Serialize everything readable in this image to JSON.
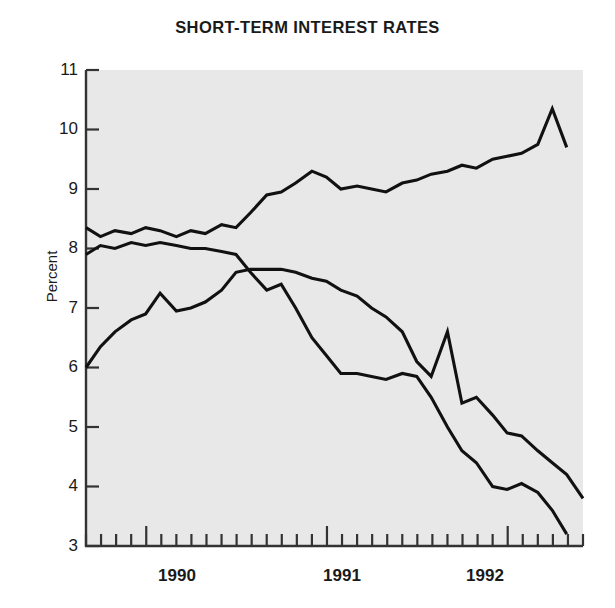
{
  "chart_data": {
    "type": "line",
    "title": "SHORT-TERM INTEREST RATES",
    "xlabel": "",
    "ylabel": "Percent",
    "ylim": [
      3,
      11
    ],
    "xlim": [
      1989.67,
      1992.42
    ],
    "grid": false,
    "legend_position": "inline-annotations",
    "y_ticks": [
      "11",
      "10",
      "9",
      "8",
      "7",
      "6",
      "5",
      "4",
      "3"
    ],
    "x_ticks": [
      "1990",
      "1991",
      "1992"
    ],
    "x_tick_interval": "monthly",
    "series": [
      {
        "name": "Germany",
        "label_x": 1990.62,
        "label_y": 8.72,
        "x": [
          1989.67,
          1989.75,
          1989.83,
          1989.92,
          1990.0,
          1990.08,
          1990.17,
          1990.25,
          1990.33,
          1990.42,
          1990.5,
          1990.58,
          1990.67,
          1990.75,
          1990.83,
          1990.92,
          1991.0,
          1991.08,
          1991.17,
          1991.25,
          1991.33,
          1991.42,
          1991.5,
          1991.58,
          1991.67,
          1991.75,
          1991.83,
          1991.92,
          1992.0,
          1992.08,
          1992.17,
          1992.25,
          1992.33
        ],
        "values": [
          8.35,
          8.2,
          8.3,
          8.25,
          8.35,
          8.3,
          8.2,
          8.3,
          8.25,
          8.4,
          8.35,
          8.6,
          8.9,
          8.95,
          9.1,
          9.3,
          9.2,
          9.0,
          9.05,
          9.0,
          8.95,
          9.1,
          9.15,
          9.25,
          9.3,
          9.4,
          9.35,
          9.5,
          9.55,
          9.6,
          9.75,
          10.35,
          9.7
        ]
      },
      {
        "name": "Japan",
        "label_x": 1991.5,
        "label_y": 6.95,
        "x": [
          1989.67,
          1989.75,
          1989.83,
          1989.92,
          1990.0,
          1990.08,
          1990.17,
          1990.25,
          1990.33,
          1990.42,
          1990.5,
          1990.58,
          1990.67,
          1990.75,
          1990.83,
          1990.92,
          1991.0,
          1991.08,
          1991.17,
          1991.25,
          1991.33,
          1991.42,
          1991.5,
          1991.58,
          1991.67,
          1991.75,
          1991.83,
          1991.92,
          1992.0,
          1992.08,
          1992.17,
          1992.25,
          1992.33,
          1992.42
        ],
        "values": [
          6.0,
          6.35,
          6.6,
          6.8,
          6.9,
          7.25,
          6.95,
          7.0,
          7.1,
          7.3,
          7.6,
          7.65,
          7.65,
          7.65,
          7.6,
          7.5,
          7.45,
          7.3,
          7.2,
          7.0,
          6.85,
          6.6,
          6.1,
          5.85,
          6.6,
          5.4,
          5.5,
          5.2,
          4.9,
          4.85,
          4.6,
          4.4,
          4.2,
          3.8
        ]
      },
      {
        "name": "United\nStates",
        "label_x": 1990.4,
        "label_y": 5.55,
        "x": [
          1989.67,
          1989.75,
          1989.83,
          1989.92,
          1990.0,
          1990.08,
          1990.17,
          1990.25,
          1990.33,
          1990.42,
          1990.5,
          1990.58,
          1990.67,
          1990.75,
          1990.83,
          1990.92,
          1991.0,
          1991.08,
          1991.17,
          1991.25,
          1991.33,
          1991.42,
          1991.5,
          1991.58,
          1991.67,
          1991.75,
          1991.83,
          1991.92,
          1992.0,
          1992.08,
          1992.17,
          1992.25,
          1992.33
        ],
        "values": [
          7.9,
          8.05,
          8.0,
          8.1,
          8.05,
          8.1,
          8.05,
          8.0,
          8.0,
          7.95,
          7.9,
          7.6,
          7.3,
          7.4,
          7.0,
          6.5,
          6.2,
          5.9,
          5.9,
          5.85,
          5.8,
          5.9,
          5.85,
          5.5,
          5.0,
          4.6,
          4.4,
          4.0,
          3.95,
          4.05,
          3.9,
          3.6,
          3.2
        ]
      }
    ]
  },
  "plot": {
    "bg_color": "#e8e8e8",
    "axis_color": "#333333",
    "line_color": "#111111"
  }
}
